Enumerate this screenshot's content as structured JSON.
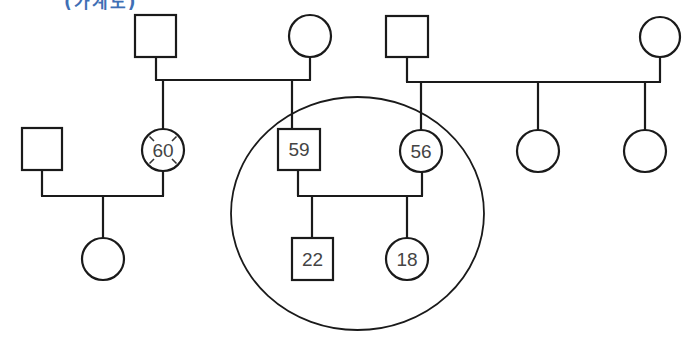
{
  "heading": {
    "text": "(가계도)",
    "color": "#3f6fb5",
    "note": "partially clipped at top edge"
  },
  "pedigree": {
    "line_color": "#1a1a1a",
    "generation_1": [
      {
        "id": "g1-m1",
        "sex": "male",
        "age": ""
      },
      {
        "id": "g1-f1",
        "sex": "female",
        "age": ""
      },
      {
        "id": "g1-m2",
        "sex": "male",
        "age": ""
      },
      {
        "id": "g1-f2",
        "sex": "female",
        "age": ""
      }
    ],
    "generation_2": [
      {
        "id": "g2-m-inlaw",
        "sex": "male",
        "age": ""
      },
      {
        "id": "g2-f-60",
        "sex": "female",
        "age": "60",
        "marked": "deceased-cross"
      },
      {
        "id": "g2-m-59",
        "sex": "male",
        "age": "59"
      },
      {
        "id": "g2-f-56",
        "sex": "female",
        "age": "56"
      },
      {
        "id": "g2-f-sib1",
        "sex": "female",
        "age": ""
      },
      {
        "id": "g2-f-sib2",
        "sex": "female",
        "age": ""
      }
    ],
    "generation_3": [
      {
        "id": "g3-f-cousin",
        "sex": "female",
        "age": ""
      },
      {
        "id": "g3-m-22",
        "sex": "male",
        "age": "22"
      },
      {
        "id": "g3-f-18",
        "sex": "female",
        "age": "18"
      }
    ],
    "household_enclosure": {
      "members": [
        "59",
        "56",
        "22",
        "18"
      ]
    }
  },
  "labels": {
    "age_60": "60",
    "age_59": "59",
    "age_56": "56",
    "age_22": "22",
    "age_18": "18"
  }
}
